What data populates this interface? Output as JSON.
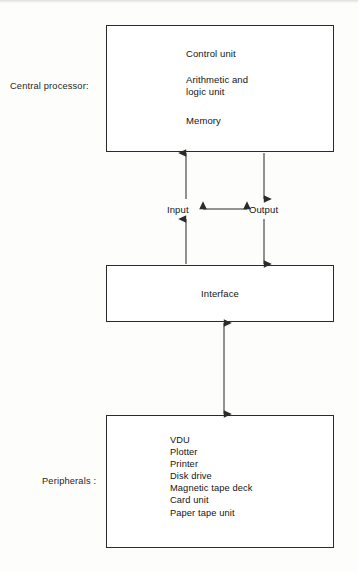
{
  "diagram": {
    "title_implicit": "Computer system block diagram",
    "side_labels": {
      "central_processor": "Central processor:",
      "peripherals": "Peripherals :"
    },
    "cpu_box": {
      "lines": [
        "Control unit",
        "Arithmetic and\nlogic unit",
        "Memory"
      ],
      "line_control": "Control unit",
      "line_alu": "Arithmetic and\nlogic unit",
      "line_memory": "Memory"
    },
    "io": {
      "input": "Input",
      "output": "Output"
    },
    "interface_box": {
      "label": "Interface"
    },
    "peripherals_box": {
      "items": [
        "VDU",
        "Plotter",
        "Printer",
        "Disk drive",
        "Magnetic tape deck",
        "Card unit",
        "Paper tape unit"
      ]
    },
    "colors": {
      "background": "#fdfdfc",
      "box_border": "#2b2b2b",
      "box_fill": "#ffffff",
      "text": "#141414",
      "arrow": "#2b2b2b"
    }
  }
}
